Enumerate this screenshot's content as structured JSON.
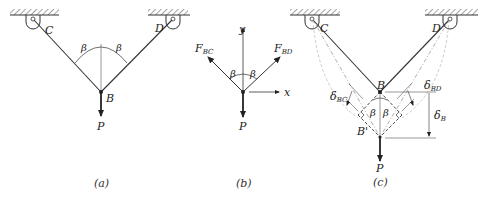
{
  "figure": {
    "panels": [
      {
        "id": "a",
        "caption": "(a)",
        "labels": {
          "C": "C",
          "D": "D",
          "B": "B",
          "P": "P",
          "beta_left": "β",
          "beta_right": "β"
        }
      },
      {
        "id": "b",
        "caption": "(b)",
        "labels": {
          "F_BC": "F",
          "F_BC_sub": "BC",
          "F_BD": "F",
          "F_BD_sub": "BD",
          "y": "y",
          "x": "x",
          "P": "P",
          "beta_left": "β",
          "beta_right": "β"
        }
      },
      {
        "id": "c",
        "caption": "(c)",
        "labels": {
          "C": "C",
          "D": "D",
          "B": "B",
          "B_prime": "B'",
          "P": "P",
          "beta_left": "β",
          "beta_right": "β",
          "delta_BC": "δ",
          "delta_BC_sub": "BC",
          "delta_BD": "δ",
          "delta_BD_sub": "BD",
          "delta_B": "δ",
          "delta_B_sub": "B"
        }
      }
    ],
    "colors": {
      "line": "#333333",
      "hatch": "#555555",
      "background": "#ffffff"
    }
  }
}
